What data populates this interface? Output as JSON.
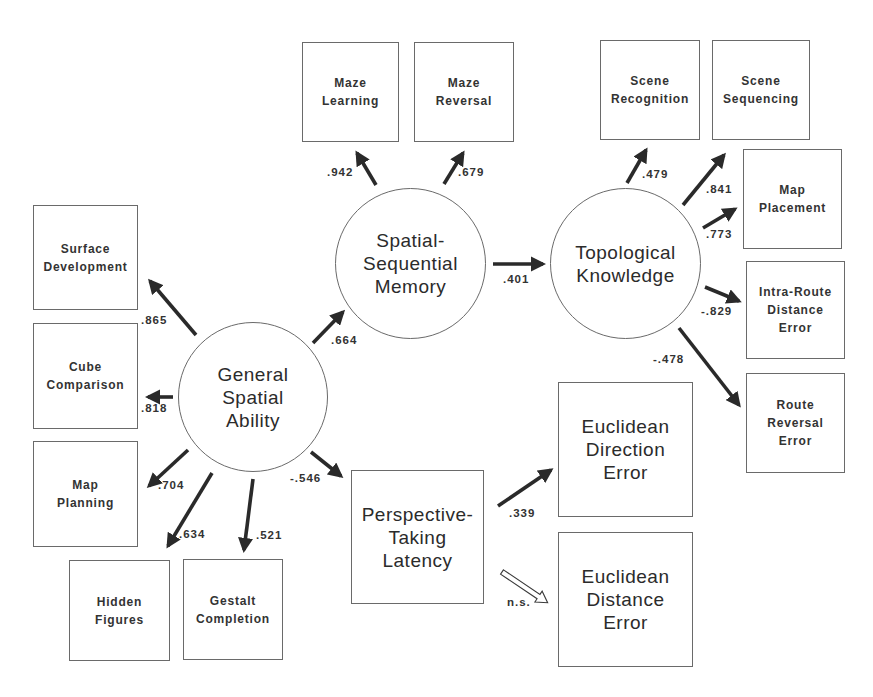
{
  "diagram": {
    "type": "structural-equation-model",
    "latent_factors": [
      {
        "id": "gsa",
        "label": "General\nSpatial\nAbility"
      },
      {
        "id": "ssm",
        "label": "Spatial-\nSequential\nMemory"
      },
      {
        "id": "tk",
        "label": "Topological\nKnowledge"
      }
    ],
    "observed_measures": [
      {
        "id": "surface",
        "label": "Surface\nDevelopment"
      },
      {
        "id": "cube",
        "label": "Cube\nComparison"
      },
      {
        "id": "mapplan",
        "label": "Map\nPlanning"
      },
      {
        "id": "hidden",
        "label": "Hidden\nFigures"
      },
      {
        "id": "gestalt",
        "label": "Gestalt\nCompletion"
      },
      {
        "id": "mazelearn",
        "label": "Maze\nLearning"
      },
      {
        "id": "mazerev",
        "label": "Maze\nReversal"
      },
      {
        "id": "scenerec",
        "label": "Scene\nRecognition"
      },
      {
        "id": "sceneseq",
        "label": "Scene\nSequencing"
      },
      {
        "id": "mapplace",
        "label": "Map\nPlacement"
      },
      {
        "id": "intraroute",
        "label": "Intra-Route\nDistance\nError"
      },
      {
        "id": "routerev",
        "label": "Route\nReversal\nError"
      },
      {
        "id": "ptl",
        "label": "Perspective-\nTaking\nLatency"
      },
      {
        "id": "eucdir",
        "label": "Euclidean\nDirection\nError"
      },
      {
        "id": "eucdist",
        "label": "Euclidean\nDistance\nError"
      }
    ],
    "paths": [
      {
        "from": "gsa",
        "to": "surface",
        "coef": ".865"
      },
      {
        "from": "gsa",
        "to": "cube",
        "coef": ".818"
      },
      {
        "from": "gsa",
        "to": "mapplan",
        "coef": ".704"
      },
      {
        "from": "gsa",
        "to": "hidden",
        "coef": ".634"
      },
      {
        "from": "gsa",
        "to": "gestalt",
        "coef": ".521"
      },
      {
        "from": "gsa",
        "to": "ssm",
        "coef": ".664"
      },
      {
        "from": "gsa",
        "to": "ptl",
        "coef": "-.546"
      },
      {
        "from": "ssm",
        "to": "mazelearn",
        "coef": ".942"
      },
      {
        "from": "ssm",
        "to": "mazerev",
        "coef": ".679"
      },
      {
        "from": "ssm",
        "to": "tk",
        "coef": ".401"
      },
      {
        "from": "tk",
        "to": "scenerec",
        "coef": ".479"
      },
      {
        "from": "tk",
        "to": "sceneseq",
        "coef": ".841"
      },
      {
        "from": "tk",
        "to": "mapplace",
        "coef": ".773"
      },
      {
        "from": "tk",
        "to": "intraroute",
        "coef": "-.829"
      },
      {
        "from": "tk",
        "to": "routerev",
        "coef": "-.478"
      },
      {
        "from": "ptl",
        "to": "eucdir",
        "coef": ".339"
      },
      {
        "from": "ptl",
        "to": "eucdist",
        "coef": "n.s.",
        "style": "hollow"
      }
    ]
  },
  "colors": {
    "stroke": "#6a6a6a",
    "arrow": "#2a2a2a",
    "text": "#2b2b2b"
  }
}
